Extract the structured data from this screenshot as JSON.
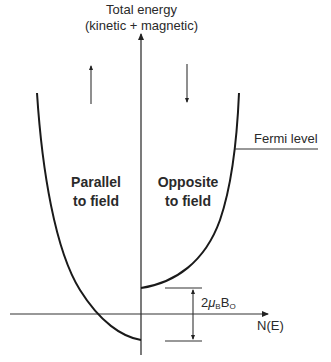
{
  "diagram": {
    "axis_title_line1": "Total energy",
    "axis_title_line2": "(kinetic + magnetic)",
    "x_axis_label": "N(E)",
    "left_region_line1": "Parallel",
    "left_region_line2": "to field",
    "right_region_line1": "Opposite",
    "right_region_line2": "to field",
    "fermi_label": "Fermi level",
    "gap_label": {
      "prefix": "2",
      "mu": "μ",
      "mu_sub": "B",
      "b": "B",
      "b_sub": "O"
    },
    "left_spin_arrow": "up",
    "right_spin_arrow": "down",
    "colors": {
      "line": "#1a1a1a",
      "axis": "#333333",
      "text": "#2a2a2a"
    }
  }
}
